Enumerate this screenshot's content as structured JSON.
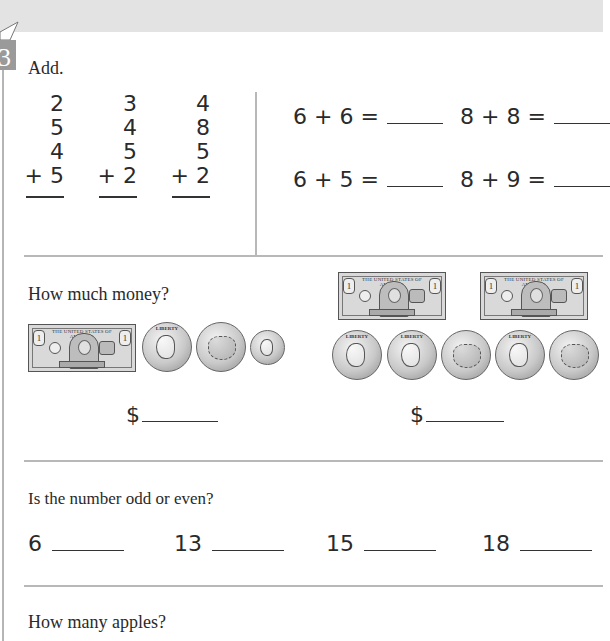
{
  "header": {
    "band_color": "#e3e3e3",
    "section_number": "3"
  },
  "add_section": {
    "prompt": "Add.",
    "vertical_problems": [
      {
        "addends": [
          "2",
          "5",
          "4"
        ],
        "last": "+ 5"
      },
      {
        "addends": [
          "3",
          "4",
          "5"
        ],
        "last": "+ 2"
      },
      {
        "addends": [
          "4",
          "8",
          "5"
        ],
        "last": "+ 2"
      }
    ],
    "equations": [
      {
        "text": "6 + 6 ="
      },
      {
        "text": "8 + 8 ="
      },
      {
        "text": "6 + 5 ="
      },
      {
        "text": "8 + 9 ="
      }
    ]
  },
  "money_section": {
    "prompt": "How much money?",
    "groups": [
      {
        "bills": 1,
        "coins": [
          "quarter",
          "quarter-back",
          "dime"
        ],
        "answer_prefix": "$"
      },
      {
        "bills": 2,
        "coins": [
          "quarter",
          "quarter",
          "quarter-back",
          "quarter",
          "quarter-back"
        ],
        "answer_prefix": "$"
      }
    ],
    "bill_text": "THE UNITED STATES OF AMERICA",
    "bill_denomination": "1",
    "coin_front_text": "LIBERTY"
  },
  "odd_even_section": {
    "prompt": "Is the number odd or even?",
    "numbers": [
      "6",
      "13",
      "15",
      "18"
    ]
  },
  "apples_section": {
    "prompt": "How many apples?"
  }
}
